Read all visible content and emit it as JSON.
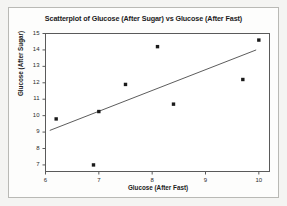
{
  "chart_data": {
    "type": "scatter",
    "title": "Scatterplot of Glucose (After Sugar) vs Glucose (After Fast)",
    "xlabel": "Glucose (After Fast)",
    "ylabel": "Glucose (After Sugar)",
    "xlim": [
      6,
      10.2
    ],
    "ylim": [
      6.6,
      15
    ],
    "xticks": [
      6,
      7,
      8,
      9,
      10
    ],
    "yticks": [
      7,
      8,
      9,
      10,
      11,
      12,
      13,
      14,
      15
    ],
    "grid": false,
    "legend": null,
    "marker_color": "#1a1a1a",
    "line_color": "#4a4a4a",
    "points": [
      {
        "x": 6.2,
        "y": 9.8
      },
      {
        "x": 6.9,
        "y": 7.0
      },
      {
        "x": 7.0,
        "y": 10.25
      },
      {
        "x": 7.5,
        "y": 11.9
      },
      {
        "x": 8.1,
        "y": 14.2
      },
      {
        "x": 8.4,
        "y": 10.7
      },
      {
        "x": 9.7,
        "y": 12.2
      },
      {
        "x": 10.0,
        "y": 14.6
      }
    ],
    "fit_line": {
      "name": "regression line",
      "x0": 6.08,
      "y0": 9.1,
      "x1": 9.95,
      "y1": 14.0
    }
  }
}
